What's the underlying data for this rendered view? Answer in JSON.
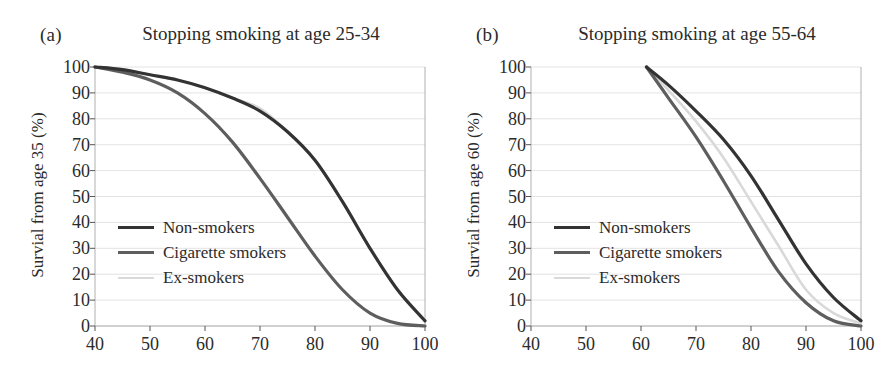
{
  "figure": {
    "panels": [
      {
        "tag": "(a)",
        "title": "Stopping smoking at age 25-34",
        "ylabel": "Survial from age 35 (%)"
      },
      {
        "tag": "(b)",
        "title": "Stopping smoking at age 55-64",
        "ylabel": "Survial from age 60 (%)"
      }
    ],
    "legend": [
      {
        "label": "Non-smokers",
        "color": "#333333",
        "width": 3.2
      },
      {
        "label": "Cigarette smokers",
        "color": "#5e5e5e",
        "width": 3.2
      },
      {
        "label": "Ex-smokers",
        "color": "#d9d9d9",
        "width": 2.6
      }
    ],
    "colors": {
      "non_smokers": "#333333",
      "cigarette_smokers": "#5e5e5e",
      "ex_smokers": "#d9d9d9",
      "gridline": "#e3e3e3",
      "axis": "#b0b0b0",
      "text": "#2b2b2b"
    }
  },
  "chart_data": [
    {
      "type": "line",
      "panel": "(a)",
      "title": "Stopping smoking at age 25-34",
      "xlabel": "",
      "ylabel": "Survial from age 35 (%)",
      "xlim": [
        40,
        100
      ],
      "ylim": [
        0,
        100
      ],
      "xticks": [
        40,
        50,
        60,
        70,
        80,
        90,
        100
      ],
      "yticks": [
        0,
        10,
        20,
        30,
        40,
        50,
        60,
        70,
        80,
        90,
        100
      ],
      "grid": "horizontal",
      "legend_position": "center-left",
      "x": [
        40,
        45,
        50,
        55,
        60,
        65,
        70,
        75,
        80,
        85,
        90,
        95,
        100
      ],
      "series": [
        {
          "name": "Non-smokers",
          "color": "#333333",
          "values": [
            100,
            99,
            97,
            95,
            92,
            88,
            83,
            75,
            64,
            48,
            30,
            14,
            2
          ]
        },
        {
          "name": "Cigarette smokers",
          "color": "#5e5e5e",
          "values": [
            100,
            98,
            95,
            90,
            82,
            71,
            57,
            42,
            27,
            14,
            5,
            1,
            0
          ]
        },
        {
          "name": "Ex-smokers",
          "color": "#d9d9d9",
          "values": [
            100,
            99,
            97,
            95,
            92,
            88,
            84,
            75,
            64,
            48,
            30,
            14,
            2
          ]
        }
      ]
    },
    {
      "type": "line",
      "panel": "(b)",
      "title": "Stopping smoking at age 55-64",
      "xlabel": "",
      "ylabel": "Survial from age 60 (%)",
      "xlim": [
        40,
        100
      ],
      "ylim": [
        0,
        100
      ],
      "xticks": [
        40,
        50,
        60,
        70,
        80,
        90,
        100
      ],
      "yticks": [
        0,
        10,
        20,
        30,
        40,
        50,
        60,
        70,
        80,
        90,
        100
      ],
      "grid": "horizontal",
      "legend_position": "center-left",
      "x": [
        61,
        65,
        70,
        75,
        80,
        85,
        90,
        95,
        100
      ],
      "series": [
        {
          "name": "Non-smokers",
          "color": "#333333",
          "values": [
            100,
            93,
            83,
            72,
            58,
            41,
            24,
            11,
            2
          ]
        },
        {
          "name": "Cigarette smokers",
          "color": "#5e5e5e",
          "values": [
            100,
            88,
            73,
            56,
            38,
            21,
            9,
            2,
            0
          ]
        },
        {
          "name": "Ex-smokers",
          "color": "#d9d9d9",
          "values": [
            100,
            91,
            79,
            65,
            48,
            31,
            14,
            5,
            1
          ]
        }
      ]
    }
  ]
}
